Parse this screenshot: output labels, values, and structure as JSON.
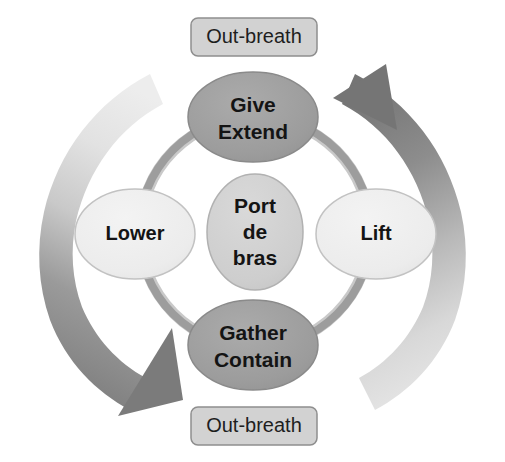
{
  "diagram": {
    "background_color": "#ffffff",
    "ring": {
      "name": "cycle-ring",
      "color": "#9d9d9d"
    },
    "breath_boxes": [
      {
        "id": "top",
        "label": "Out-breath",
        "fill": "#d2d2d2",
        "stroke": "#8e8e8e"
      },
      {
        "id": "bottom",
        "label": "Out-breath",
        "fill": "#d2d2d2",
        "stroke": "#8e8e8e"
      }
    ],
    "nodes": {
      "top": {
        "name": "give-extend",
        "line1": "Give",
        "line2": "Extend",
        "fill": "#9e9e9e",
        "stroke": "#8a8a8a"
      },
      "bottom": {
        "name": "gather-contain",
        "line1": "Gather",
        "line2": "Contain",
        "fill": "#9e9e9e",
        "stroke": "#8a8a8a"
      },
      "left": {
        "name": "lower",
        "line1": "Lower",
        "fill": "#ededed",
        "stroke": "#c6c6c6"
      },
      "right": {
        "name": "lift",
        "line1": "Lift",
        "fill": "#ededed",
        "stroke": "#c6c6c6"
      },
      "center": {
        "name": "port-de-bras",
        "line1": "Port",
        "line2": "de",
        "line3": "bras",
        "fill": "#cfcfcf",
        "stroke": "#b4b4b4"
      }
    },
    "arrows": [
      {
        "name": "left-descending-arrow",
        "direction": "down-right",
        "gradient_from": "#e9e9e9",
        "gradient_to": "#7d7d7d"
      },
      {
        "name": "right-ascending-arrow",
        "direction": "up-left",
        "gradient_from": "#e4e4e4",
        "gradient_to": "#787878"
      }
    ]
  }
}
